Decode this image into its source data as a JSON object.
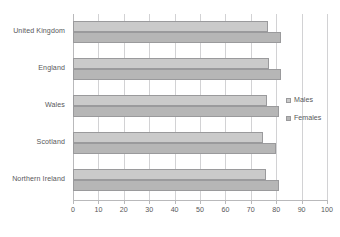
{
  "chart_data": {
    "type": "bar",
    "orientation": "horizontal",
    "title": "",
    "xlabel": "",
    "ylabel": "",
    "categories": [
      "United Kingdom",
      "England",
      "Wales",
      "Scotland",
      "Northern Ireland"
    ],
    "series": [
      {
        "name": "Males",
        "values": [
          76.8,
          77.1,
          76.5,
          74.8,
          76.0
        ]
      },
      {
        "name": "Females",
        "values": [
          81.9,
          82.0,
          81.0,
          80.0,
          81.1
        ]
      }
    ],
    "xlim": [
      0,
      100
    ],
    "xticks": [
      0,
      10,
      20,
      30,
      40,
      50,
      60,
      70,
      80,
      90,
      100
    ],
    "xtick_labels": [
      "0",
      "10",
      "20",
      "30",
      "40",
      "50",
      "60",
      "70",
      "80",
      "90",
      "100"
    ],
    "grid": true,
    "grid_axis": "x",
    "legend": [
      "Males",
      "Females"
    ],
    "legend_position": "right",
    "colors": {
      "males": "#cacaca",
      "females": "#b6b6b6",
      "bar_border": "#9a9a9c",
      "gridline": "#d2d2d4",
      "axis": "#b9b9bb",
      "text": "#58585a",
      "background": "#ffffff"
    }
  }
}
